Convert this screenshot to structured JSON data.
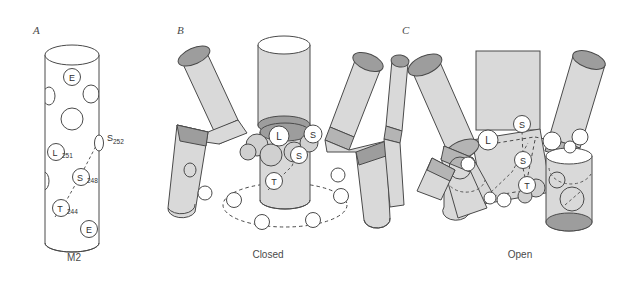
{
  "figure": {
    "background": "#ffffff",
    "panels": [
      {
        "letter": "A",
        "caption": "M2",
        "description": "Single M2 transmembrane helix cylinder with pore-lining residues",
        "residue_labels": [
          {
            "id": "E-top",
            "letter": "E",
            "subscript": ""
          },
          {
            "id": "S252",
            "letter": "S",
            "subscript": "252"
          },
          {
            "id": "L251",
            "letter": "L",
            "subscript": "251"
          },
          {
            "id": "S248",
            "letter": "S",
            "subscript": "248"
          },
          {
            "id": "T244",
            "letter": "T",
            "subscript": "244"
          },
          {
            "id": "E-bot",
            "letter": "E",
            "subscript": ""
          }
        ]
      },
      {
        "letter": "B",
        "caption": "Closed",
        "description": "Five M2 helices bent inward forming a closed gate",
        "residue_labels": [
          {
            "id": "L",
            "letter": "L",
            "subscript": ""
          },
          {
            "id": "S-upper",
            "letter": "S",
            "subscript": ""
          },
          {
            "id": "S-lower",
            "letter": "S",
            "subscript": ""
          },
          {
            "id": "T",
            "letter": "T",
            "subscript": ""
          }
        ]
      },
      {
        "letter": "C",
        "caption": "Open",
        "description": "Five M2 helices splayed outward forming an open pore",
        "residue_labels": [
          {
            "id": "S-upper",
            "letter": "S",
            "subscript": ""
          },
          {
            "id": "L",
            "letter": "L",
            "subscript": ""
          },
          {
            "id": "S-lower",
            "letter": "S",
            "subscript": ""
          },
          {
            "id": "T",
            "letter": "T",
            "subscript": ""
          }
        ]
      }
    ],
    "colors": {
      "helix_body": "#d9d9d9",
      "helix_cap": "#9d9d9d",
      "helix_cap_dark": "#8f8f8f",
      "outline": "#4a4a4a",
      "residue_fill": "#ffffff",
      "text": "#3a3a3a",
      "dash": "#5a5a5a"
    }
  }
}
